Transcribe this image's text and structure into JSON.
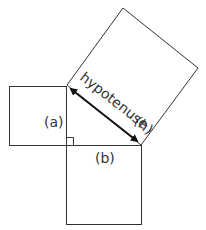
{
  "diagram": {
    "labels": {
      "a": "(a)",
      "b": "(b)",
      "hypotenuse": "hypotenuse",
      "h": "(h)"
    },
    "colors": {
      "stroke": "#333333",
      "arrow": "#111111",
      "background": "#ffffff"
    }
  }
}
